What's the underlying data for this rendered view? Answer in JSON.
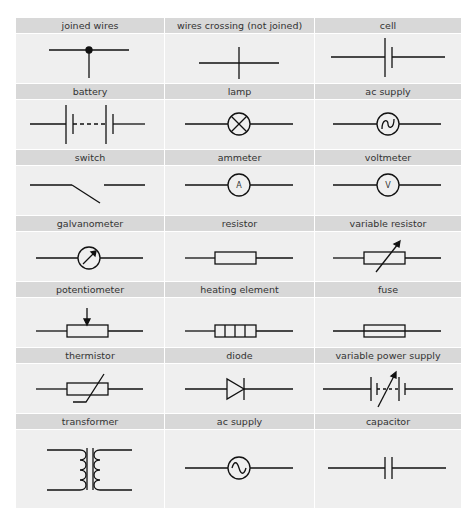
{
  "columns": 3,
  "colors": {
    "header_bg": "#d8d8d8",
    "cell_bg": "#efefef",
    "text": "#333333",
    "line": "#111111"
  },
  "symbols": [
    {
      "label": "joined wires",
      "icon": "joined-wires-icon"
    },
    {
      "label": "wires crossing (not joined)",
      "icon": "wires-crossing-icon"
    },
    {
      "label": "cell",
      "icon": "cell-icon"
    },
    {
      "label": "battery",
      "icon": "battery-icon"
    },
    {
      "label": "lamp",
      "icon": "lamp-icon"
    },
    {
      "label": "ac supply",
      "icon": "ac-supply-icon"
    },
    {
      "label": "switch",
      "icon": "switch-icon"
    },
    {
      "label": "ammeter",
      "icon": "ammeter-icon",
      "glyph": "A"
    },
    {
      "label": "voltmeter",
      "icon": "voltmeter-icon",
      "glyph": "V"
    },
    {
      "label": "galvanometer",
      "icon": "galvanometer-icon"
    },
    {
      "label": "resistor",
      "icon": "resistor-icon"
    },
    {
      "label": "variable resistor",
      "icon": "variable-resistor-icon"
    },
    {
      "label": "potentiometer",
      "icon": "potentiometer-icon"
    },
    {
      "label": "heating element",
      "icon": "heating-element-icon"
    },
    {
      "label": "fuse",
      "icon": "fuse-icon"
    },
    {
      "label": "thermistor",
      "icon": "thermistor-icon"
    },
    {
      "label": "diode",
      "icon": "diode-icon"
    },
    {
      "label": "variable power supply",
      "icon": "variable-power-supply-icon"
    },
    {
      "label": "transformer",
      "icon": "transformer-icon"
    },
    {
      "label": "ac supply",
      "icon": "ac-supply-icon"
    },
    {
      "label": "capacitor",
      "icon": "capacitor-icon"
    }
  ]
}
